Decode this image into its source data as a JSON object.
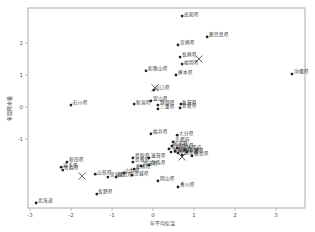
{
  "chart_data": {
    "type": "scatter",
    "title": "",
    "xlabel": "年平均気温",
    "ylabel": "年間降水量",
    "xlim": [
      -3.0,
      3.7
    ],
    "ylim": [
      -3.1,
      3.1
    ],
    "xticks": [
      -3,
      -2,
      -1,
      0,
      1,
      2,
      3
    ],
    "yticks": [
      -1,
      0,
      1,
      2
    ],
    "grid": false,
    "legend": null,
    "points": [
      {
        "label": "高知県",
        "x": 0.71,
        "y": 2.84
      },
      {
        "label": "鹿児島県",
        "x": 1.32,
        "y": 2.19
      },
      {
        "label": "宮崎県",
        "x": 0.61,
        "y": 1.94
      },
      {
        "label": "長崎県",
        "x": 0.66,
        "y": 1.56
      },
      {
        "label": "福岡県",
        "x": 0.71,
        "y": 1.34
      },
      {
        "label": "熊本県",
        "x": 0.56,
        "y": 1.0
      },
      {
        "label": "沖縄県",
        "x": 3.39,
        "y": 1.03
      },
      {
        "label": "和歌山県",
        "x": -0.17,
        "y": 1.13
      },
      {
        "label": "山口県",
        "x": 0.02,
        "y": 0.53
      },
      {
        "label": "富山県",
        "x": -0.05,
        "y": 0.19
      },
      {
        "label": "新潟県",
        "x": -0.46,
        "y": 0.09
      },
      {
        "label": "静岡県",
        "x": 0.12,
        "y": 0.06
      },
      {
        "label": "三重県",
        "x": 0.12,
        "y": -0.06
      },
      {
        "label": "佐賀県",
        "x": 0.68,
        "y": 0.09
      },
      {
        "label": "愛媛県",
        "x": 0.66,
        "y": -0.03
      },
      {
        "label": "石川県",
        "x": -2.0,
        "y": 0.06
      },
      {
        "label": "福井県",
        "x": -0.05,
        "y": -0.84
      },
      {
        "label": "大分県",
        "x": 0.59,
        "y": -0.88
      },
      {
        "label": "京都府",
        "x": 0.49,
        "y": -1.09
      },
      {
        "label": "岐阜県",
        "x": 0.46,
        "y": -1.22
      },
      {
        "label": "兵庫県",
        "x": 0.59,
        "y": -1.28
      },
      {
        "label": "奈良県",
        "x": 0.39,
        "y": -1.31
      },
      {
        "label": "大阪府",
        "x": 0.78,
        "y": -1.34
      },
      {
        "label": "愛知県",
        "x": 0.44,
        "y": -1.41
      },
      {
        "label": "広島県",
        "x": 0.71,
        "y": -1.5
      },
      {
        "label": "東京都",
        "x": 0.54,
        "y": -1.38
      },
      {
        "label": "千葉県",
        "x": 0.83,
        "y": -1.41
      },
      {
        "label": "神奈川県",
        "x": 0.61,
        "y": -1.44
      },
      {
        "label": "徳島県",
        "x": 0.95,
        "y": -1.53
      },
      {
        "label": "岡山県",
        "x": 0.12,
        "y": -2.31
      },
      {
        "label": "香川県",
        "x": 0.61,
        "y": -2.5
      },
      {
        "label": "鳥取県",
        "x": -0.49,
        "y": -1.59
      },
      {
        "label": "島根県",
        "x": -0.49,
        "y": -1.72
      },
      {
        "label": "滋賀県",
        "x": -0.1,
        "y": -1.59
      },
      {
        "label": "群馬県",
        "x": -0.1,
        "y": -1.81
      },
      {
        "label": "埼玉県",
        "x": -0.29,
        "y": -1.84
      },
      {
        "label": "栃木県",
        "x": -0.46,
        "y": -1.94
      },
      {
        "label": "茨城県",
        "x": -0.51,
        "y": -2.13
      },
      {
        "label": "山梨県",
        "x": -0.71,
        "y": -2.06
      },
      {
        "label": "福島県",
        "x": -0.9,
        "y": -2.19
      },
      {
        "label": "宮城県",
        "x": -1.1,
        "y": -2.19
      },
      {
        "label": "山形県",
        "x": -1.41,
        "y": -2.1
      },
      {
        "label": "長野県",
        "x": -1.37,
        "y": -2.72
      },
      {
        "label": "秋田県",
        "x": -2.1,
        "y": -1.72
      },
      {
        "label": "岩手県",
        "x": -2.24,
        "y": -1.88
      },
      {
        "label": "青森県",
        "x": -2.2,
        "y": -1.97
      },
      {
        "label": "北海道",
        "x": -2.85,
        "y": -3.0
      }
    ],
    "centroids": [
      {
        "x": 1.12,
        "y": 1.5
      },
      {
        "x": 0.05,
        "y": 0.6
      },
      {
        "x": 0.71,
        "y": -1.56
      },
      {
        "x": -1.73,
        "y": -2.16
      }
    ]
  },
  "axes": {
    "xlabel": "年平均気温",
    "ylabel": "年間降水量",
    "xtick_labels": [
      "-3",
      "-2",
      "-1",
      "0",
      "1",
      "2",
      "3"
    ],
    "ytick_labels": [
      "-1",
      "0",
      "1",
      "2"
    ]
  }
}
